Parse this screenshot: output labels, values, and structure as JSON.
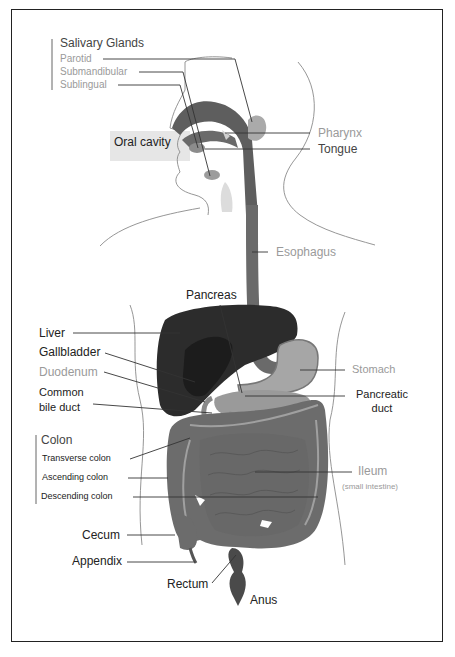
{
  "diagram": {
    "colors": {
      "organ_dark": "#2a2a2a",
      "organ_mid": "#5a5a5a",
      "organ_gut": "#6e6e6e",
      "organ_light": "#a8a8a8",
      "outline": "#777777",
      "leader_line": "#222222",
      "label_dark": "#222222",
      "label_light": "#9a9a9a"
    },
    "labels": {
      "salivary_glands": {
        "group": "Salivary Glands",
        "parotid": "Parotid",
        "submandibular": "Submandibular",
        "sublingual": "Sublingual"
      },
      "oral_cavity": "Oral cavity",
      "pharynx": "Pharynx",
      "tongue": "Tongue",
      "esophagus": "Esophagus",
      "pancreas": "Pancreas",
      "liver": "Liver",
      "gallbladder": "Gallbladder",
      "duodenum": "Duodenum",
      "common_bile_duct_line1": "Common",
      "common_bile_duct_line2": "bile duct",
      "stomach": "Stomach",
      "pancreatic_duct_line1": "Pancreatic",
      "pancreatic_duct_line2": "duct",
      "colon": {
        "group": "Colon",
        "transverse": "Transverse colon",
        "ascending": "Ascending colon",
        "descending": "Descending colon"
      },
      "ileum": "Ileum",
      "ileum_note": "(small intestine)",
      "cecum": "Cecum",
      "appendix": "Appendix",
      "rectum": "Rectum",
      "anus": "Anus"
    }
  }
}
